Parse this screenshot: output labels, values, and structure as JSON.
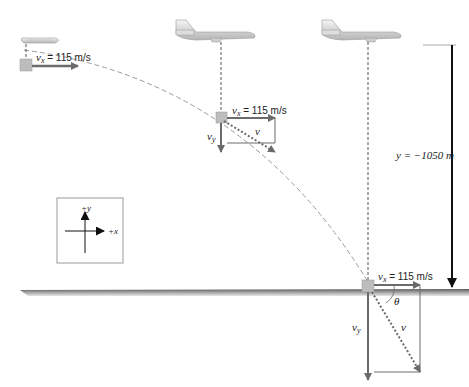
{
  "diagram": {
    "velocity_x_label": "v",
    "velocity_x_sub": "x",
    "velocity_x_value": " = 115 m/s",
    "velocity_y_label": "v",
    "velocity_y_sub": "y",
    "velocity_label": "v",
    "angle_label": "θ",
    "height_label": "y = −1050 m",
    "axes": {
      "y_label": "+y",
      "x_label": "+x"
    },
    "positions": [
      {
        "name": "release",
        "vx": "115 m/s",
        "shows_vy": false
      },
      {
        "name": "mid-flight",
        "vx": "115 m/s",
        "shows_vy": true
      },
      {
        "name": "impact",
        "vx": "115 m/s",
        "shows_vy": true,
        "shows_angle": true
      }
    ],
    "colors": {
      "vector": "#6b6b6b",
      "package": "#bdbdbd",
      "ground": "#8a8a8a",
      "height_arrow": "#111111",
      "trajectory": "#9a9a9a"
    }
  }
}
